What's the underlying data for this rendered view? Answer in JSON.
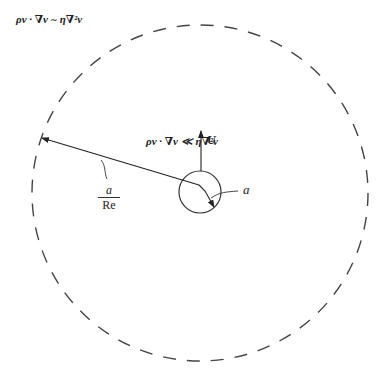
{
  "diagram": {
    "outer_region_label": "ρv · ∇v ~ η∇²v",
    "inner_region_label": "ρv · ∇v ≪ η∇²v",
    "velocity_label": "U",
    "sphere_radius_label": "a",
    "outer_radius_label": {
      "numerator": "a",
      "denominator": "Re"
    },
    "outer_circle": {
      "cx": 200,
      "cy": 193,
      "r": 168,
      "style": "dashed"
    },
    "sphere": {
      "cx": 200,
      "cy": 193,
      "r": 21
    },
    "colors": {
      "stroke": "#333333",
      "text": "#222222",
      "background": "#ffffff"
    }
  }
}
